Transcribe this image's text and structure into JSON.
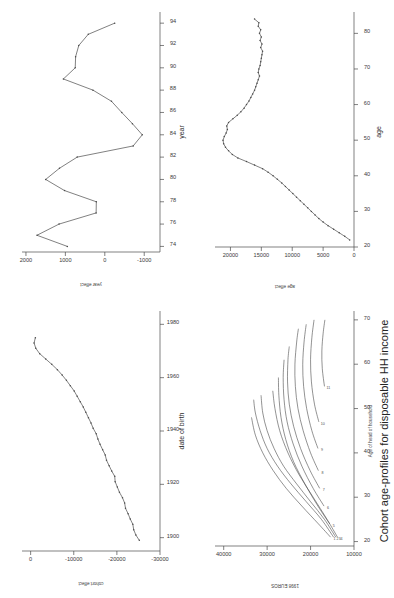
{
  "figure": {
    "orientation": "rotated-90-ccw",
    "panel_count": 4,
    "line_color": "#4a4a4a",
    "axis_color": "#4a4a4a",
    "background": "#ffffff"
  },
  "panels": {
    "cohort_effect": {
      "name": "cohort-effect-plot",
      "xlabel": "date of birth",
      "ylabel": "cohort effect",
      "xticks": [
        "1900",
        "1920",
        "1940",
        "1960",
        "1980"
      ],
      "yticks": [
        "0",
        "-10000",
        "-20000",
        "-30000"
      ]
    },
    "year_effect": {
      "name": "year-effect-plot",
      "xlabel": "year",
      "ylabel": "year effect",
      "xticks": [
        "74",
        "76",
        "78",
        "80",
        "82",
        "84",
        "86",
        "88",
        "90",
        "92",
        "94"
      ],
      "yticks": [
        "2000",
        "1000",
        "0",
        "-1000"
      ]
    },
    "cohort_profiles": {
      "name": "cohort-age-profiles-plot",
      "title": "Cohort age-profiles for disposable HH income",
      "subtitle": "Age of head of household",
      "ylabel": "1998 EUROS",
      "xticks": [
        "20",
        "30",
        "40",
        "50",
        "60",
        "70"
      ],
      "yticks": [
        "10000",
        "20000",
        "30000",
        "40000"
      ]
    },
    "age_effect": {
      "name": "age-effect-plot",
      "xlabel": "age",
      "ylabel": "age effect",
      "xticks": [
        "20",
        "30",
        "40",
        "50",
        "60",
        "70",
        "80"
      ],
      "yticks": [
        "0",
        "5000",
        "10000",
        "15000",
        "20000"
      ]
    }
  },
  "chart_data": [
    {
      "type": "line",
      "id": "cohort_effect",
      "title": "",
      "xlabel": "date of birth",
      "ylabel": "cohort effect",
      "xlim": [
        1895,
        1985
      ],
      "ylim": [
        -30000,
        2000
      ],
      "grid": false,
      "legend": "none",
      "x": [
        1899,
        1901,
        1903,
        1905,
        1907,
        1909,
        1911,
        1913,
        1915,
        1917,
        1919,
        1921,
        1923,
        1925,
        1927,
        1929,
        1931,
        1933,
        1935,
        1937,
        1939,
        1941,
        1943,
        1945,
        1947,
        1949,
        1951,
        1953,
        1955,
        1957,
        1959,
        1961,
        1963,
        1965,
        1967,
        1969,
        1971,
        1973,
        1975
      ],
      "y": [
        -25200,
        -24400,
        -23900,
        -23700,
        -23100,
        -22600,
        -22000,
        -21800,
        -21300,
        -20600,
        -20100,
        -19600,
        -19500,
        -18800,
        -18200,
        -17600,
        -17300,
        -16700,
        -16100,
        -15600,
        -15200,
        -14500,
        -14000,
        -13400,
        -12800,
        -12200,
        -11500,
        -10800,
        -10100,
        -9200,
        -8300,
        -7300,
        -6200,
        -4900,
        -3500,
        -2100,
        -1200,
        -800,
        -1100
      ]
    },
    {
      "type": "line",
      "id": "year_effect",
      "title": "",
      "xlabel": "year",
      "ylabel": "year effect",
      "xlim": [
        73.5,
        95
      ],
      "ylim": [
        -1400,
        2100
      ],
      "grid": false,
      "legend": "none",
      "x": [
        74,
        75,
        76,
        77,
        78,
        79,
        80,
        81,
        82,
        83,
        84,
        85,
        86,
        87,
        88,
        89,
        90,
        91,
        92,
        93,
        94
      ],
      "y": [
        950,
        1720,
        1160,
        220,
        215,
        1020,
        1500,
        1150,
        700,
        -720,
        -950,
        -700,
        -430,
        -170,
        300,
        1050,
        750,
        740,
        660,
        420,
        -250
      ]
    },
    {
      "type": "line",
      "id": "cohort_profiles",
      "title": "Cohort age-profiles for disposable HH income",
      "xlabel": "Age of head of household",
      "ylabel": "1998 EUROS",
      "xlim": [
        19,
        72
      ],
      "ylim": [
        10000,
        42000
      ],
      "grid": false,
      "legend": "none",
      "series": [
        {
          "name": "1",
          "label": "1",
          "x": [
            21,
            24,
            28,
            32,
            36,
            40,
            44,
            48
          ],
          "y": [
            15400,
            18200,
            22000,
            25600,
            28600,
            31000,
            32700,
            33600
          ]
        },
        {
          "name": "2",
          "label": "2",
          "x": [
            21,
            25,
            29,
            33,
            37,
            41,
            45,
            49,
            52
          ],
          "y": [
            14700,
            17500,
            21000,
            24500,
            27600,
            30000,
            31600,
            32700,
            33100
          ]
        },
        {
          "name": "3",
          "label": "3",
          "x": [
            21,
            25,
            29,
            33,
            37,
            41,
            45,
            49,
            53
          ],
          "y": [
            14200,
            16800,
            20000,
            23200,
            26200,
            28400,
            30000,
            31000,
            31400
          ]
        },
        {
          "name": "4",
          "label": "4",
          "x": [
            21,
            25,
            30,
            35,
            40,
            45,
            50,
            54
          ],
          "y": [
            13800,
            16200,
            19400,
            22600,
            25200,
            27100,
            28200,
            28700
          ]
        },
        {
          "name": "5",
          "label": "5",
          "x": [
            24,
            28,
            33,
            38,
            43,
            48,
            53,
            57
          ],
          "y": [
            15600,
            18300,
            21300,
            23900,
            25700,
            26800,
            27300,
            27400
          ]
        },
        {
          "name": "6",
          "label": "6",
          "x": [
            28,
            32,
            37,
            42,
            47,
            52,
            57,
            61
          ],
          "y": [
            16900,
            19400,
            22000,
            24000,
            25400,
            26100,
            26300,
            26100
          ]
        },
        {
          "name": "7",
          "label": "7",
          "x": [
            32,
            36,
            41,
            46,
            51,
            56,
            61,
            64
          ],
          "y": [
            17900,
            20100,
            22300,
            23900,
            24900,
            25300,
            25200,
            24900
          ]
        },
        {
          "name": "8",
          "label": "8",
          "x": [
            36,
            40,
            45,
            50,
            55,
            60,
            65,
            68
          ],
          "y": [
            18200,
            20000,
            21700,
            22900,
            23500,
            23600,
            23200,
            22800
          ]
        },
        {
          "name": "9",
          "label": "9",
          "x": [
            41,
            45,
            50,
            55,
            60,
            65,
            69
          ],
          "y": [
            18300,
            19700,
            20900,
            21600,
            21800,
            21500,
            21000
          ]
        },
        {
          "name": "10",
          "label": "10",
          "x": [
            47,
            51,
            56,
            61,
            66,
            70
          ],
          "y": [
            18100,
            19100,
            19800,
            20000,
            19700,
            19200
          ]
        },
        {
          "name": "11",
          "label": "11",
          "x": [
            55,
            59,
            63,
            67,
            70
          ],
          "y": [
            16800,
            17300,
            17400,
            17100,
            16700
          ]
        }
      ]
    },
    {
      "type": "line",
      "id": "age_effect",
      "title": "",
      "xlabel": "age",
      "ylabel": "age effect",
      "xlim": [
        20,
        86
      ],
      "ylim": [
        0,
        22500
      ],
      "grid": false,
      "legend": "none",
      "x": [
        22,
        23,
        24,
        25,
        26,
        27,
        28,
        29,
        30,
        31,
        32,
        33,
        34,
        35,
        36,
        37,
        38,
        39,
        40,
        41,
        42,
        43,
        44,
        45,
        46,
        47,
        48,
        49,
        50,
        51,
        52,
        53,
        54,
        55,
        56,
        57,
        58,
        59,
        60,
        61,
        62,
        63,
        64,
        65,
        66,
        67,
        68,
        69,
        70,
        71,
        72,
        73,
        74,
        75,
        76,
        77,
        78,
        79,
        80,
        81,
        82,
        83,
        84
      ],
      "y": [
        700,
        1500,
        2400,
        3300,
        4200,
        5000,
        5700,
        6300,
        6900,
        7500,
        8100,
        8700,
        9300,
        9900,
        10500,
        11100,
        11700,
        12400,
        13100,
        13900,
        14800,
        16100,
        17400,
        18800,
        19700,
        20300,
        20800,
        21100,
        21200,
        21000,
        20700,
        20500,
        20600,
        20300,
        19600,
        18900,
        18300,
        17800,
        17400,
        17000,
        16700,
        16400,
        16100,
        15900,
        15700,
        15500,
        15300,
        15500,
        15400,
        15200,
        15100,
        15000,
        14900,
        14800,
        15100,
        14900,
        15200,
        15000,
        15300,
        15100,
        15500,
        15400,
        16100
      ]
    }
  ]
}
